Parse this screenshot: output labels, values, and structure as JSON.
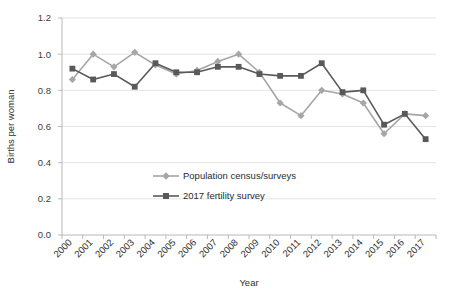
{
  "chart_data": {
    "type": "line",
    "title": "",
    "xlabel": "Year",
    "ylabel": "Births per woman",
    "categories": [
      "2000",
      "2001",
      "2002",
      "2003",
      "2004",
      "2005",
      "2006",
      "2007",
      "2008",
      "2009",
      "2010",
      "2011",
      "2012",
      "2013",
      "2014",
      "2015",
      "2016",
      "2017"
    ],
    "x": [
      2000,
      2001,
      2002,
      2003,
      2004,
      2005,
      2006,
      2007,
      2008,
      2009,
      2010,
      2011,
      2012,
      2013,
      2014,
      2015,
      2016,
      2017
    ],
    "ylim": [
      0.0,
      1.2
    ],
    "yticks": [
      "0.0",
      "0.2",
      "0.4",
      "0.6",
      "0.8",
      "1.0",
      "1.2"
    ],
    "ytick_values": [
      0.0,
      0.2,
      0.4,
      0.6,
      0.8,
      1.0,
      1.2
    ],
    "grid": "horizontal",
    "legend_position": "center",
    "series": [
      {
        "name": "Population census/surveys",
        "color": "#a6a6a6",
        "marker": "diamond",
        "values": [
          0.86,
          1.0,
          0.93,
          1.01,
          0.94,
          0.89,
          0.91,
          0.96,
          1.0,
          0.9,
          0.73,
          0.66,
          0.8,
          0.78,
          0.73,
          0.56,
          0.67,
          0.66
        ]
      },
      {
        "name": "2017 fertility survey",
        "color": "#595959",
        "marker": "square",
        "values": [
          0.92,
          0.86,
          0.89,
          0.82,
          0.95,
          0.9,
          0.9,
          0.93,
          0.93,
          0.89,
          0.88,
          0.88,
          0.95,
          0.79,
          0.8,
          0.61,
          0.67,
          0.53
        ]
      }
    ]
  },
  "legend": {
    "items": [
      {
        "label": "Population census/surveys"
      },
      {
        "label": "2017 fertility survey"
      }
    ]
  },
  "axes": {
    "y_title": "Births per woman",
    "x_title": "Year"
  }
}
